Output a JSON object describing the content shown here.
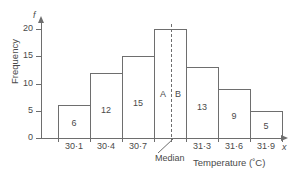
{
  "chart_data": {
    "type": "bar",
    "title": "",
    "xlabel": "Temperature (˚C)",
    "ylabel": "Frequency",
    "x_axis_variable": "x",
    "y_axis_variable": "f",
    "categories": [
      "30·1",
      "30·4",
      "30·7",
      "31·0",
      "31·3",
      "31·6",
      "31·9"
    ],
    "values": [
      6,
      12,
      15,
      20,
      13,
      9,
      5
    ],
    "bar_labels": [
      "6",
      "12",
      "15",
      "",
      "13",
      "9",
      "5"
    ],
    "tick_labels": [
      "30·1",
      "30·4",
      "30·7",
      "31·3",
      "31·6",
      "31·9"
    ],
    "ytick_labels": [
      "0",
      "5",
      "10",
      "15",
      "20"
    ],
    "ytick_values": [
      0,
      5,
      10,
      15,
      20
    ],
    "ylim": [
      0,
      22
    ],
    "grid": false,
    "legend": "none",
    "annotations": {
      "median_label": "Median",
      "region_a": "A",
      "region_b": "B"
    }
  },
  "axes": {
    "y_variable": "f",
    "x_variable": "x",
    "y_title": "Frequency",
    "x_title": "Temperature (˚C)"
  },
  "median": {
    "label": "Median",
    "left_region": "A",
    "right_region": "B"
  },
  "colors": {
    "stroke": "#6e6e6e",
    "text": "#4a4a4a",
    "background": "#ffffff"
  }
}
